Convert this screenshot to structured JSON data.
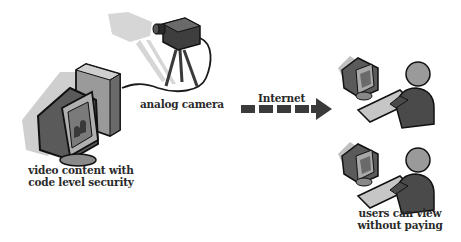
{
  "diagram": {
    "nodes": [
      {
        "id": "source",
        "icon": "computer-monitor-icon",
        "label_lines": [
          "video content with",
          "code level security"
        ]
      },
      {
        "id": "camera",
        "icon": "video-camera-icon",
        "label_lines": [
          "analog camera"
        ]
      },
      {
        "id": "user1",
        "icon": "user-at-computer-icon",
        "label_lines": []
      },
      {
        "id": "user2",
        "icon": "user-at-computer-icon",
        "label_lines": [
          "users can view",
          "without paying"
        ]
      }
    ],
    "edges": [
      {
        "from": "camera",
        "to": "source",
        "style": "cable"
      },
      {
        "from": "source",
        "to": "users",
        "style": "dashed-arrow",
        "label": "Internet"
      }
    ]
  },
  "labels": {
    "camera": "analog camera",
    "source_line1": "video content with",
    "source_line2": "code level security",
    "internet": "Internet",
    "users_line1": "users can view",
    "users_line2": "without paying"
  },
  "colors": {
    "outline": "#1a1a1a",
    "dark": "#4a4a4a",
    "mid": "#8a8a8a",
    "light": "#c8c8c8",
    "shadow": "#d4d4d4",
    "text": "#2a2a2a"
  }
}
